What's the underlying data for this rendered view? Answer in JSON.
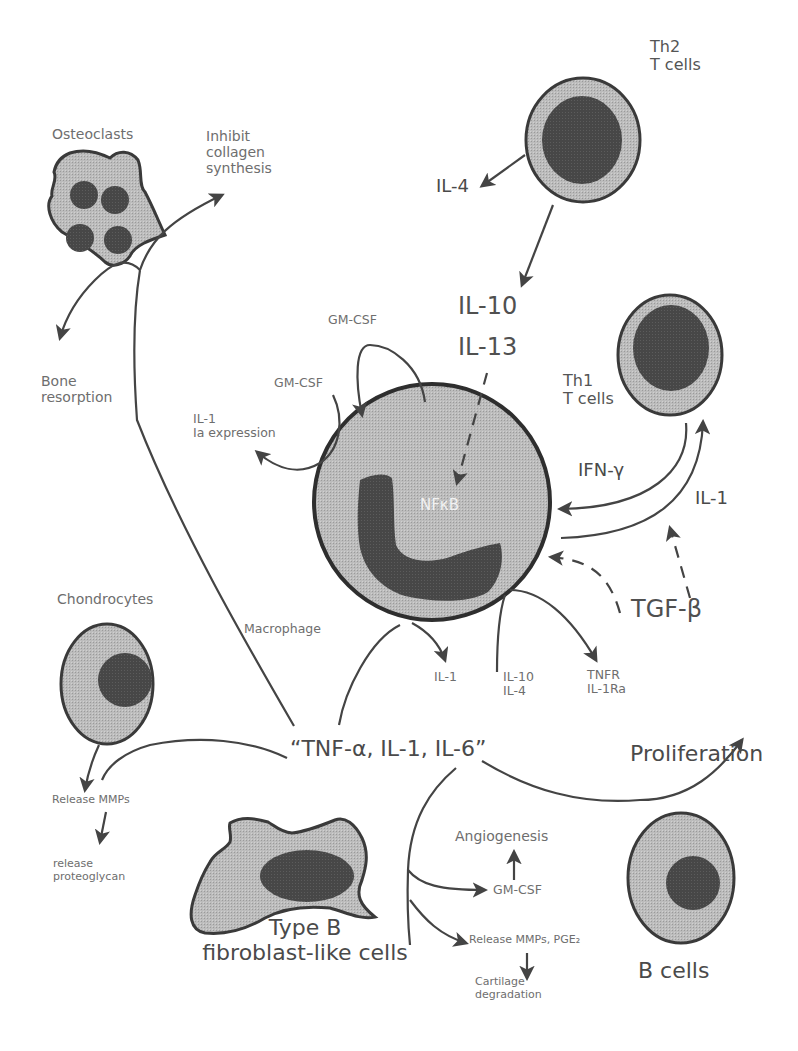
{
  "diagram": {
    "central_cell": {
      "name": "Macrophage",
      "nucleus_label": "NFκB"
    },
    "cells": {
      "th2": {
        "line1": "Th2",
        "line2": "T cells"
      },
      "th1": {
        "line1": "Th1",
        "line2": "T cells"
      },
      "osteoclasts": "Osteoclasts",
      "chondrocytes": "Chondrocytes",
      "fibroblast": {
        "line1": "Type B",
        "line2": "fibroblast-like cells"
      },
      "b_cells": "B cells"
    },
    "labels": {
      "il4_top": "IL-4",
      "il10": "IL-10",
      "il13": "IL-13",
      "inhibit": [
        "Inhibit",
        "collagen",
        "synthesis"
      ],
      "bone": [
        "Bone",
        "resorption"
      ],
      "gmcsf_top": "GM-CSF",
      "gmcsf_left": "GM-CSF",
      "il1_ia": [
        "IL-1",
        "Ia expression"
      ],
      "ifn": "IFN-γ",
      "il1_right": "IL-1",
      "tgf": "TGF-β",
      "il1_bottom": "IL-1",
      "il10_il4": [
        "IL-10",
        "IL-4"
      ],
      "tnfr": [
        "TNFR",
        "IL-1Ra"
      ],
      "cytokines": "“TNF-α, IL-1, IL-6”",
      "proliferation": "Proliferation",
      "release_mmps": "Release MMPs",
      "release_proteo": [
        "release",
        "proteoglycan"
      ],
      "angiogenesis": "Angiogenesis",
      "gmcsf_bottom": "GM-CSF",
      "release_mmps_pge": "Release MMPs, PGE₂",
      "cartilage": [
        "Cartilage",
        "degradation"
      ]
    },
    "colors": {
      "cell_fill": "#b8b8b8",
      "nucleus_fill": "#444444",
      "outline": "#3a3a3a",
      "text": "#6e6e6e"
    }
  }
}
